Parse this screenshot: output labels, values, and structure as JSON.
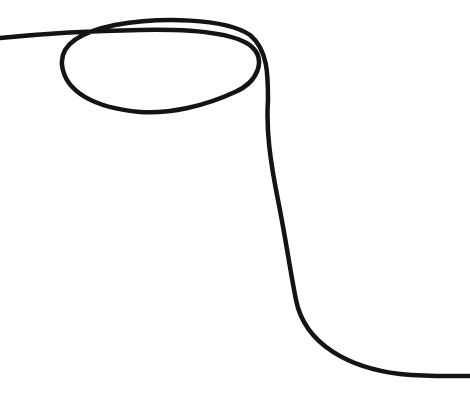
{
  "image": {
    "width": 470,
    "height": 402,
    "background": "#ffffff",
    "subject": "single black cord with a loop on a white background"
  },
  "cord": {
    "color": "#141414",
    "stroke_width": 4.5,
    "path": "M 0 38 C 40 34, 80 31, 140 30 C 190 29, 235 32, 252 47 C 266 60, 258 82, 235 92 C 205 106, 170 114, 140 112 C 95 108, 65 92, 62 65 C 60 45, 80 32, 115 25 C 160 17, 225 18, 250 35 C 268 50, 268 75, 268 100 C 266 130, 270 160, 278 200 C 286 240, 290 270, 296 300 C 305 345, 350 368, 400 374 C 430 377, 455 376, 470 376"
  }
}
